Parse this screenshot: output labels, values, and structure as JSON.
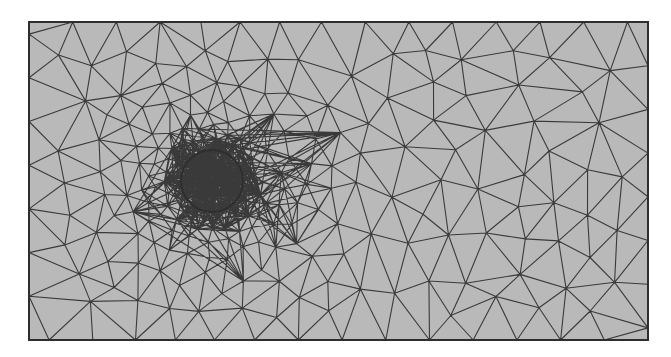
{
  "figure": {
    "domain": {
      "shape": "rectangle",
      "x": 29,
      "y": 22,
      "width": 619,
      "height": 318
    },
    "obstacle": {
      "shape": "circle",
      "cx": 212,
      "cy": 181,
      "r": 31
    },
    "colors": {
      "fill": "#b9b9b9",
      "edge": "#3a3a3a",
      "border": "#2e2e2e",
      "background": "#ffffff"
    },
    "mesh": {
      "element_type": "triangle",
      "refinement": "graded, finest near circular obstacle",
      "coarse_size": 46,
      "fine_size": 7
    }
  }
}
